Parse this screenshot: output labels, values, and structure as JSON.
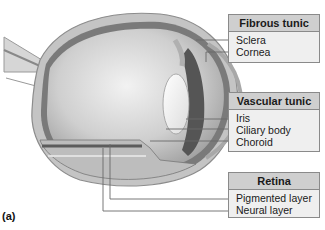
{
  "figure": {
    "panel_letter": "(a)"
  },
  "groups": [
    {
      "title": "Fibrous tunic",
      "items": [
        "Sclera",
        "Cornea"
      ]
    },
    {
      "title": "Vascular tunic",
      "items": [
        "Iris",
        "Ciliary body",
        "Choroid"
      ]
    },
    {
      "title": "Retina",
      "items": [
        "Pigmented layer",
        "Neural layer"
      ]
    }
  ],
  "colors": {
    "header_bg": "#cfcfcf",
    "box_bg": "#efefef",
    "box_border": "#8a8a8a",
    "leader_line": "#6a6a6a"
  }
}
